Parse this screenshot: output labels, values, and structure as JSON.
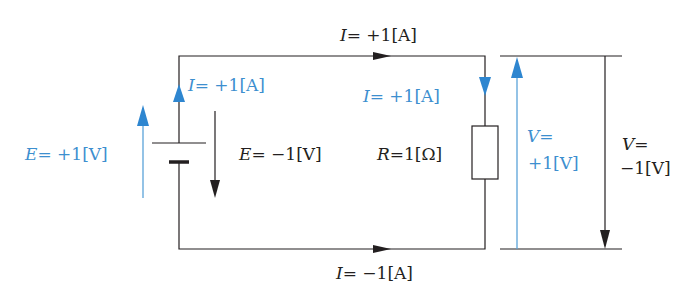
{
  "colors": {
    "black": "#231f20",
    "blue": "#3d8fcf",
    "blue_arrow": "#2e86d0"
  },
  "labels": {
    "top_current": {
      "var": "I",
      "text": "= +1[A]"
    },
    "left_current_blue": {
      "var": "I",
      "text": "= +1[A]"
    },
    "right_current_blue": {
      "var": "I",
      "text": "= +1[A]"
    },
    "bottom_current": {
      "var": "I",
      "text": "= −1[A]"
    },
    "emf_blue": {
      "var": "E",
      "text": "= +1[V]"
    },
    "emf_black": {
      "var": "E",
      "text": "= −1[V]"
    },
    "resistance": {
      "var": "R",
      "text": "=1[Ω]"
    },
    "voltage_blue_line1": {
      "var": "V",
      "text": "="
    },
    "voltage_blue_line2": "+1[V]",
    "voltage_black_line1": {
      "var": "V",
      "text": "="
    },
    "voltage_black_line2": "−1[V]"
  }
}
